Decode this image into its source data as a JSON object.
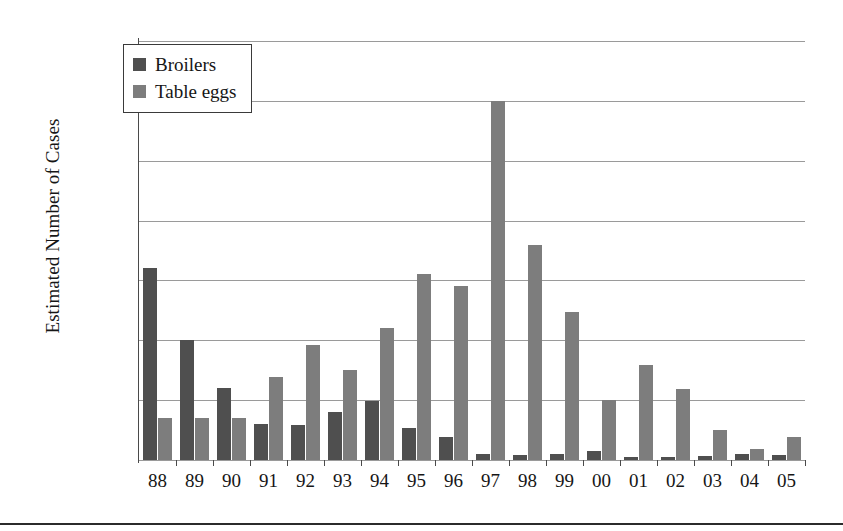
{
  "chart_data": {
    "type": "bar",
    "title": "",
    "xlabel": "",
    "ylabel": "Estimated Number of Cases",
    "ylim": [
      0,
      3500
    ],
    "ytick_step": 500,
    "yticks": [
      0,
      500,
      1000,
      1500,
      2000,
      2500,
      3000,
      3500
    ],
    "ytick_labels": [
      "0",
      "500",
      "1000",
      "1500",
      "2000",
      "2500",
      "3000",
      "3500"
    ],
    "grid": true,
    "legend_position": "top-left",
    "categories": [
      "88",
      "89",
      "90",
      "91",
      "92",
      "93",
      "94",
      "95",
      "96",
      "97",
      "98",
      "99",
      "00",
      "01",
      "02",
      "03",
      "04",
      "05"
    ],
    "series": [
      {
        "name": "Broilers",
        "color": "#4f4f4f",
        "values": [
          1600,
          1000,
          600,
          300,
          290,
          400,
          490,
          270,
          190,
          50,
          40,
          50,
          75,
          25,
          25,
          30,
          50,
          45
        ]
      },
      {
        "name": "Table eggs",
        "color": "#7d7d7d",
        "values": [
          350,
          350,
          350,
          690,
          960,
          750,
          1100,
          1550,
          1450,
          3000,
          1800,
          1240,
          500,
          790,
          590,
          250,
          90,
          190
        ]
      }
    ]
  },
  "legend": {
    "items": [
      {
        "label": "Broilers"
      },
      {
        "label": "Table eggs"
      }
    ]
  },
  "axis": {
    "y_title": "Estimated Number of Cases"
  }
}
